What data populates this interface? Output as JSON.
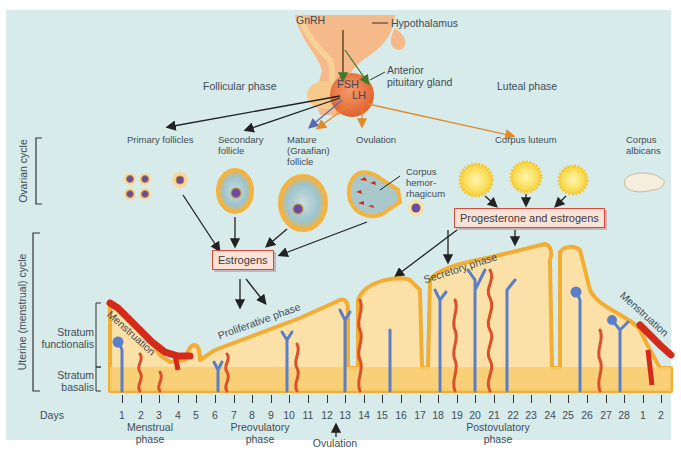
{
  "hypothalamus": {
    "hormone": "GnRH",
    "label": "Hypothalamus"
  },
  "pituitary": {
    "fsh": "FSH",
    "lh": "LH",
    "label_line1": "Anterior",
    "label_line2": "pituitary gland"
  },
  "phases_top": {
    "follicular": "Follicular phase",
    "luteal": "Luteal phase"
  },
  "ovarian": {
    "section_label": "Ovarian cycle",
    "stages": [
      {
        "label": "Primary follicles"
      },
      {
        "label_line1": "Secondary",
        "label_line2": "follicle"
      },
      {
        "label_line1": "Mature",
        "label_line2": "(Graafian)",
        "label_line3": "follicle"
      },
      {
        "label": "Ovulation"
      },
      {
        "label": "Corpus luteum"
      },
      {
        "label_line1": "Corpus",
        "label_line2": "albicans"
      }
    ],
    "corpus_hemorrhagicum": {
      "line1": "Corpus",
      "line2": "hemor-",
      "line3": "rhagicum"
    }
  },
  "hormone_boxes": {
    "estrogens": "Estrogens",
    "progesterone": "Progesterone and estrogens"
  },
  "uterine": {
    "section_label": "Uterine (menstrual) cycle",
    "stratum_functionalis_line1": "Stratum",
    "stratum_functionalis_line2": "functionalis",
    "stratum_basalis_line1": "Stratum",
    "stratum_basalis_line2": "basalis",
    "menstruation_left": "Menstruation",
    "menstruation_right": "Menstruation",
    "proliferative": "Proliferative phase",
    "secretory": "Secretory phase"
  },
  "timeline": {
    "days_label": "Days",
    "days": [
      "1",
      "2",
      "3",
      "4",
      "5",
      "6",
      "7",
      "8",
      "9",
      "10",
      "11",
      "12",
      "13",
      "14",
      "15",
      "16",
      "17",
      "18",
      "19",
      "20",
      "21",
      "22",
      "23",
      "24",
      "25",
      "26",
      "27",
      "28",
      "1",
      "2"
    ],
    "phases": {
      "menstrual_line1": "Menstrual",
      "menstrual_line2": "phase",
      "preovulatory_line1": "Preovulatory",
      "preovulatory_line2": "phase",
      "ovulation": "Ovulation",
      "postovulatory_line1": "Postovulatory",
      "postovulatory_line2": "phase"
    }
  },
  "colors": {
    "background": "#d8ebeb",
    "endometrium_fill": "#fbe0a8",
    "endometrium_edge": "#f2ad33",
    "basalis_fill": "#f8cc70",
    "menstrual_red": "#d42a1a",
    "artery": "#d9502a",
    "vein": "#5a7fc8",
    "box_border": "#d9493a",
    "box_fill": "#fbe2d6"
  }
}
